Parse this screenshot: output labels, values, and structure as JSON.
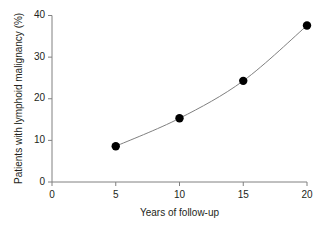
{
  "chart_data": {
    "type": "line",
    "title": "",
    "subtitle": "",
    "xlabel": "Years of follow-up",
    "ylabel": "Patients with lymphoid malignancy (%)",
    "x": [
      5,
      10,
      15,
      20
    ],
    "values": [
      8.6,
      15.3,
      24.3,
      37.6
    ],
    "series": [
      {
        "name": "Patients with lymphoid malignancy",
        "x": [
          5,
          10,
          15,
          20
        ],
        "values": [
          8.6,
          15.3,
          24.3,
          37.6
        ]
      }
    ],
    "xlim": [
      0,
      20
    ],
    "ylim": [
      0,
      40
    ],
    "xticks": [
      0,
      5,
      10,
      15,
      20
    ],
    "yticks": [
      0,
      10,
      20,
      30,
      40
    ],
    "xtick_labels": [
      "0",
      "5",
      "10",
      "15",
      "20"
    ],
    "ytick_labels": [
      "0",
      "10",
      "20",
      "30",
      "40"
    ],
    "grid": false,
    "legend": false,
    "legend_position": "none",
    "marker": "filled-circle",
    "marker_color": "#000000",
    "line_color": "#808080",
    "axis_color": "#808080",
    "background_color": "#ffffff",
    "annotations": []
  }
}
